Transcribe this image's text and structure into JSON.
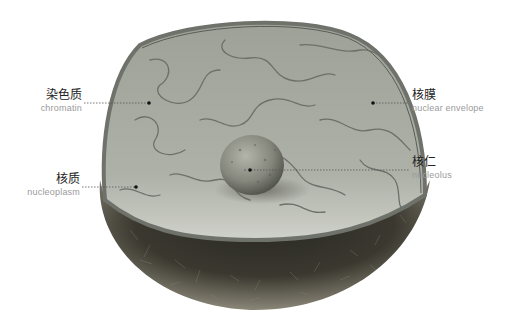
{
  "diagram": {
    "labels": [
      {
        "id": "chromatin",
        "zh": "染色质",
        "en": "chromatin"
      },
      {
        "id": "nuclear-envelope",
        "zh": "核膜",
        "en": "nuclear envelope"
      },
      {
        "id": "nucleolus",
        "zh": "核仁",
        "en": "nucleolus"
      },
      {
        "id": "nucleoplasm",
        "zh": "核质",
        "en": "nucleoplasm"
      }
    ],
    "colors": {
      "cut_face": "#a7aaa2",
      "rim": "#7f827b",
      "lower_shell": "#3c3a33",
      "chromatin_lines": "#6d706a",
      "nucleolus": "#8e8f86",
      "leader_line": "#555555"
    }
  }
}
